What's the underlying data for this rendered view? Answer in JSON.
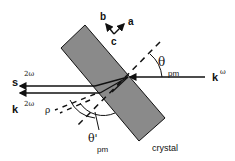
{
  "diagram": {
    "axes": {
      "a": "a",
      "b": "b",
      "c": "c"
    },
    "incident_wave": {
      "symbol": "k",
      "superscript": "ω"
    },
    "harmonic_wave_s": {
      "symbol": "s",
      "superscript": "2ω"
    },
    "harmonic_wave_k": {
      "symbol": "k",
      "superscript": "2ω"
    },
    "angle_pm": {
      "symbol": "θ",
      "subscript": "pm"
    },
    "angle_pm_prime": {
      "symbol": "θ'",
      "subscript": "pm"
    },
    "walkoff_angle": {
      "symbol": "ρ"
    },
    "crystal_label": "crystal",
    "colors": {
      "crystal_fill": "#8a8a8a",
      "line": "#111111"
    }
  }
}
